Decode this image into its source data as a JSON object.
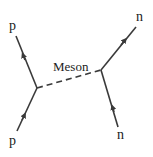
{
  "diagram": {
    "type": "feynman-diagram",
    "line_color": "#3a3a3a",
    "labels": {
      "top_left": "p",
      "bottom_left": "p",
      "top_right": "n",
      "bottom_right": "n",
      "exchange": "Meson"
    },
    "vertices": [
      {
        "id": "left",
        "x": 37,
        "y": 88
      },
      {
        "id": "right",
        "x": 101,
        "y": 70
      }
    ],
    "edges": [
      {
        "from": "bottom_left_p",
        "to": "left",
        "style": "solid",
        "arrow": "toward-vertex"
      },
      {
        "from": "left",
        "to": "top_left_p",
        "style": "solid",
        "arrow": "away-from-vertex"
      },
      {
        "from": "bottom_right_n",
        "to": "right",
        "style": "solid",
        "arrow": "toward-vertex"
      },
      {
        "from": "right",
        "to": "top_right_n",
        "style": "solid",
        "arrow": "away-from-vertex"
      },
      {
        "from": "left",
        "to": "right",
        "style": "dashed",
        "label": "Meson"
      }
    ]
  }
}
